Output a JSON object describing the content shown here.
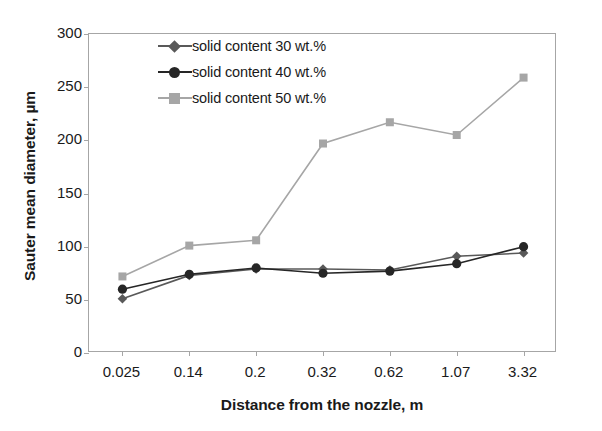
{
  "chart_data": {
    "type": "line",
    "title": "",
    "xlabel": "Distance from the nozzle, m",
    "ylabel": "Sauter mean diameter, µm",
    "categories": [
      "0.025",
      "0.14",
      "0.2",
      "0.32",
      "0.62",
      "1.07",
      "3.32"
    ],
    "ylim": [
      0,
      300
    ],
    "yticks": [
      "0",
      "50",
      "100",
      "150",
      "200",
      "250",
      "300"
    ],
    "ytick_step": 50,
    "grid": false,
    "legend_position": "top-left-inside",
    "series": [
      {
        "name": "solid content 30 wt.%",
        "color": "#595959",
        "marker": "diamond",
        "values": [
          51,
          73,
          79,
          79,
          78,
          91,
          94
        ]
      },
      {
        "name": "solid content 40 wt.%",
        "color": "#262626",
        "marker": "circle",
        "values": [
          60,
          74,
          80,
          75,
          77,
          84,
          100
        ]
      },
      {
        "name": "solid content 50 wt.%",
        "color": "#a6a6a6",
        "marker": "square",
        "values": [
          72,
          101,
          106,
          197,
          217,
          205,
          259
        ]
      }
    ]
  },
  "axis": {
    "x_title": "Distance from the nozzle, m",
    "y_title": "Sauter mean diameter, µm"
  },
  "legend": {
    "items": [
      {
        "label": "solid content 30 wt.%"
      },
      {
        "label": "solid content 40 wt.%"
      },
      {
        "label": "solid content 50 wt.%"
      }
    ]
  },
  "colors": {
    "series_30": "#595959",
    "series_40": "#262626",
    "series_50": "#a6a6a6",
    "axis": "#a6a6a6",
    "text": "#1a1a1a",
    "background": "#ffffff"
  }
}
